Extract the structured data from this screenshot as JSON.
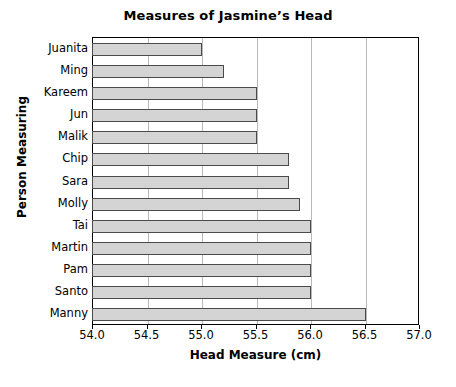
{
  "chart_data": {
    "type": "bar",
    "orientation": "horizontal",
    "title": "Measures of Jasmine’s Head",
    "xlabel": "Head Measure (cm)",
    "ylabel": "Person Measuring",
    "categories": [
      "Juanita",
      "Ming",
      "Kareem",
      "Jun",
      "Malik",
      "Chip",
      "Sara",
      "Molly",
      "Tai",
      "Martin",
      "Pam",
      "Santo",
      "Manny"
    ],
    "values": [
      55.0,
      55.2,
      55.5,
      55.5,
      55.5,
      55.8,
      55.8,
      55.9,
      56.0,
      56.0,
      56.0,
      56.0,
      56.5
    ],
    "xlim": [
      54.0,
      57.0
    ],
    "xticks": [
      54.0,
      54.5,
      55.0,
      55.5,
      56.0,
      56.5,
      57.0
    ],
    "xtick_labels": [
      "54.0",
      "54.5",
      "55.0",
      "55.5",
      "56.0",
      "56.5",
      "57.0"
    ],
    "grid": "vertical",
    "legend": null,
    "bar_fill_color": "#d4d4d4",
    "bar_edge_color": "#4a4a4a",
    "gridline_color": "#b9b9b9",
    "axis_color": "#000000",
    "background_color": "#ffffff"
  }
}
